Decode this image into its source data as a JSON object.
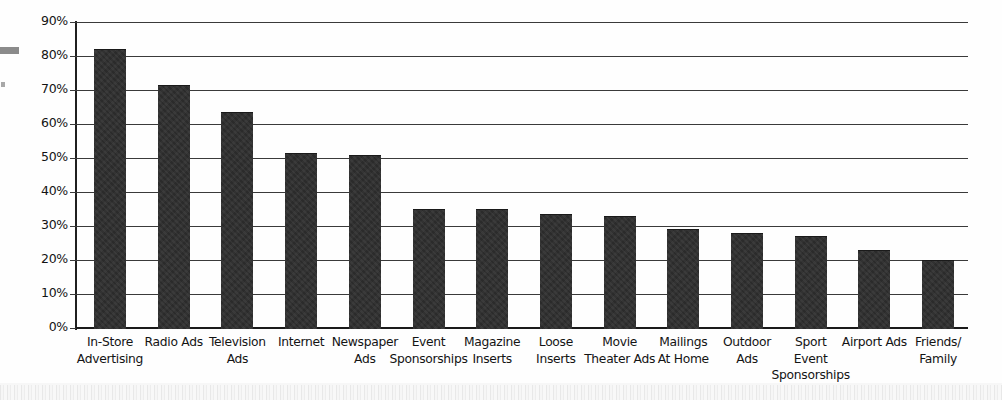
{
  "chart_data": {
    "type": "bar",
    "title": "",
    "subtitle": "",
    "xlabel": "",
    "ylabel": "",
    "ylim": [
      0,
      90
    ],
    "ytick_labels": [
      "0%",
      "10%",
      "20%",
      "30%",
      "40%",
      "50%",
      "60%",
      "70%",
      "80%",
      "90%"
    ],
    "yticks": [
      0,
      10,
      20,
      30,
      40,
      50,
      60,
      70,
      80,
      90
    ],
    "grid": true,
    "legend": "none",
    "bar_color": "#2b2b2b",
    "axis_color": "#1f1f1f",
    "categories": [
      "In-Store\nAdvertising",
      "Radio Ads",
      "Television\nAds",
      "Internet",
      "Newspaper\nAds",
      "Event\nSponsorships",
      "Magazine\nInserts",
      "Loose\nInserts",
      "Movie\nTheater Ads",
      "Mailings\nAt Home",
      "Outdoor\nAds",
      "Sport\nEvent\nSponsorships",
      "Airport Ads",
      "Friends/\nFamily"
    ],
    "values": [
      82,
      71.5,
      63.5,
      51.5,
      51,
      35,
      35,
      33.5,
      33,
      29,
      28,
      27,
      23,
      20
    ]
  },
  "artifacts": {
    "edge_dash": "page-edge-mark",
    "edge_dot": "page-edge-speck",
    "bottom_strip": "scanned-page-edge"
  }
}
